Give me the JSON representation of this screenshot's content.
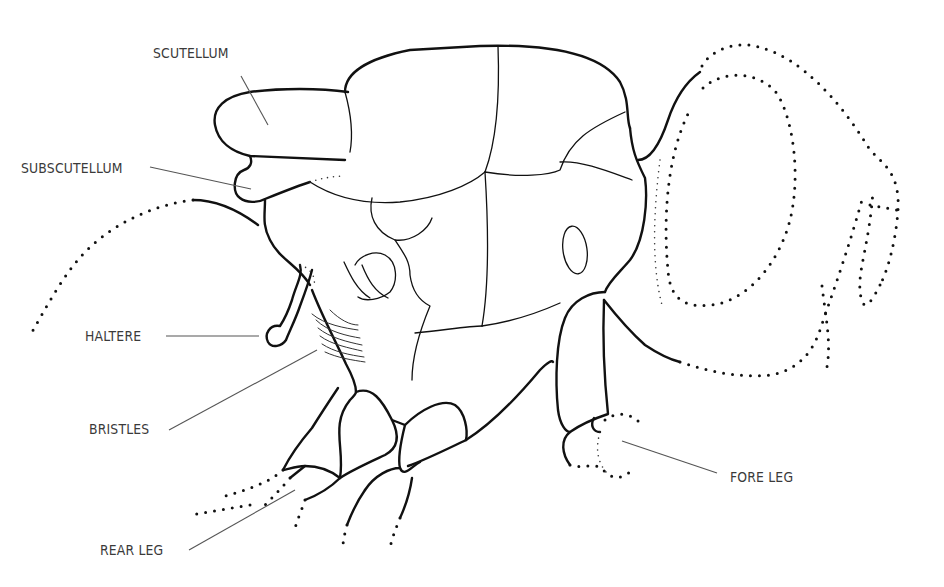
{
  "diagram": {
    "labels": [
      {
        "id": "scutellum",
        "text": "SCUTELLUM",
        "x": 153,
        "y": 45,
        "leader": [
          241,
          76,
          268,
          125
        ]
      },
      {
        "id": "subscutellum",
        "text": "SUBSCUTELLUM",
        "x": 21,
        "y": 160,
        "leader": [
          150,
          167,
          251,
          189
        ]
      },
      {
        "id": "haltere",
        "text": "HALTERE",
        "x": 85,
        "y": 328,
        "leader": [
          166,
          336,
          259,
          336
        ]
      },
      {
        "id": "bristles",
        "text": "BRISTLES",
        "x": 89,
        "y": 421,
        "leader": [
          169,
          430,
          317,
          350
        ]
      },
      {
        "id": "fore-leg",
        "text": "FORE LEG",
        "x": 730,
        "y": 469,
        "leader": [
          717,
          473,
          622,
          441
        ]
      },
      {
        "id": "rear-leg",
        "text": "REAR LEG",
        "x": 100,
        "y": 542,
        "leader": [
          189,
          550,
          295,
          490
        ]
      }
    ],
    "colors": {
      "background": "#ffffff",
      "line": "#111111",
      "label": "#3a3a3a"
    }
  }
}
